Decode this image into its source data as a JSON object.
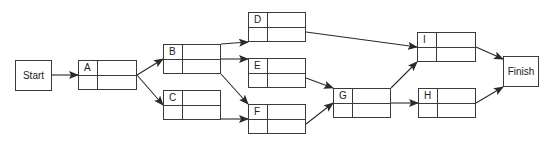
{
  "diagram": {
    "type": "activity-on-node network",
    "terminals": [
      {
        "id": "start",
        "label": "Start",
        "x": 15,
        "y": 60,
        "w": 37,
        "h": 31
      },
      {
        "id": "finish",
        "label": "Finish",
        "x": 503,
        "y": 56,
        "w": 36,
        "h": 31
      }
    ],
    "activities": [
      {
        "id": "A",
        "label": "A",
        "x": 78,
        "y": 60,
        "w": 59,
        "h": 30
      },
      {
        "id": "B",
        "label": "B",
        "x": 163,
        "y": 44,
        "w": 58,
        "h": 30
      },
      {
        "id": "C",
        "label": "C",
        "x": 163,
        "y": 90,
        "w": 58,
        "h": 30
      },
      {
        "id": "D",
        "label": "D",
        "x": 248,
        "y": 12,
        "w": 58,
        "h": 30
      },
      {
        "id": "E",
        "label": "E",
        "x": 248,
        "y": 58,
        "w": 58,
        "h": 30
      },
      {
        "id": "F",
        "label": "F",
        "x": 248,
        "y": 104,
        "w": 58,
        "h": 30
      },
      {
        "id": "G",
        "label": "G",
        "x": 333,
        "y": 88,
        "w": 58,
        "h": 30
      },
      {
        "id": "I",
        "label": "I",
        "x": 417,
        "y": 32,
        "w": 59,
        "h": 30
      },
      {
        "id": "H",
        "label": "H",
        "x": 418,
        "y": 88,
        "w": 58,
        "h": 30
      }
    ],
    "edges": [
      {
        "from": "Start",
        "to": "A"
      },
      {
        "from": "A",
        "to": "B"
      },
      {
        "from": "A",
        "to": "C"
      },
      {
        "from": "B",
        "to": "D"
      },
      {
        "from": "B",
        "to": "E"
      },
      {
        "from": "B",
        "to": "F"
      },
      {
        "from": "C",
        "to": "F"
      },
      {
        "from": "D",
        "to": "I"
      },
      {
        "from": "E",
        "to": "G"
      },
      {
        "from": "F",
        "to": "G"
      },
      {
        "from": "G",
        "to": "I"
      },
      {
        "from": "G",
        "to": "H"
      },
      {
        "from": "I",
        "to": "Finish"
      },
      {
        "from": "H",
        "to": "Finish"
      }
    ]
  }
}
